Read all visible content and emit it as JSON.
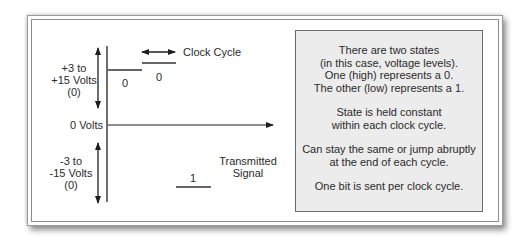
{
  "diagram": {
    "high_voltage_label": [
      "+3 to",
      "+15 Volts",
      "(0)"
    ],
    "zero_volts_label": "0 Volts",
    "low_voltage_label": [
      "-3 to",
      "-15 Volts",
      "(0)"
    ],
    "clock_cycle_label": "Clock Cycle",
    "signal_label": [
      "Transmitted",
      "Signal"
    ],
    "bits": [
      {
        "value": "0",
        "level": "high"
      },
      {
        "value": "0",
        "level": "high"
      },
      {
        "value": "1",
        "level": "low"
      }
    ]
  },
  "info_box": {
    "paragraphs": [
      [
        "There are two states",
        "(in this case, voltage levels).",
        "One (high) represents a 0.",
        "The other (low) represents a 1."
      ],
      [
        "State is held constant",
        "within each clock cycle."
      ],
      [
        "Can stay the same or jump abruptly",
        "at the end of each cycle."
      ],
      [
        "One bit is sent per clock cycle."
      ]
    ]
  },
  "colors": {
    "line": "#1e1e1e",
    "box_fill": "#ececec",
    "frame_border": "#9a9a9a"
  }
}
